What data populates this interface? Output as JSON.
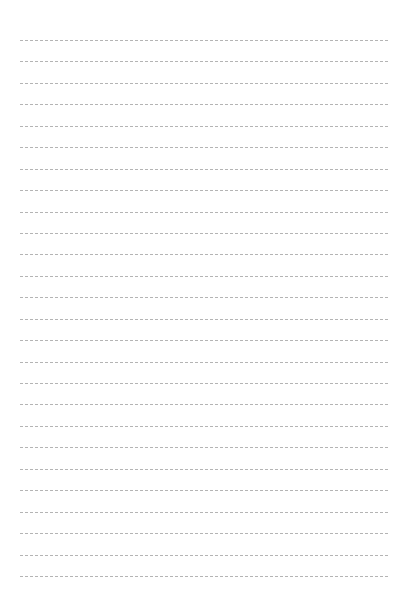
{
  "page": {
    "type": "lined-paper",
    "background_color": "#ffffff",
    "line_color": "#b4b4b4",
    "line_style": "dashed",
    "line_count": 26,
    "first_line_y": 40,
    "line_spacing": 21.44,
    "line_left": 20,
    "line_right": 388
  }
}
